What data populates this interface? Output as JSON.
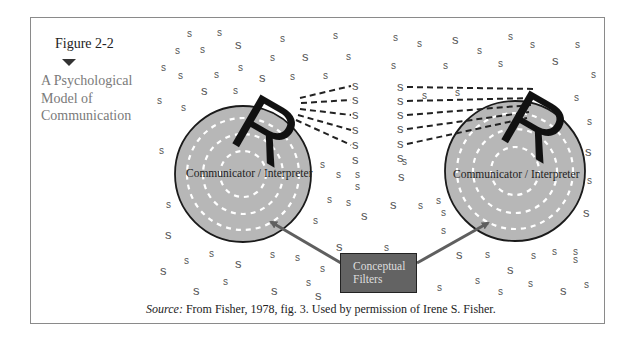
{
  "figure": {
    "label": "Figure 2-2",
    "title_lines": [
      "A Psychological",
      "Model of",
      "Communication"
    ]
  },
  "communicators": [
    {
      "label": "Communicator / Interpreter",
      "cx": 243,
      "cy": 174,
      "r": 68,
      "r_letter": "R"
    },
    {
      "label": "Communicator / Interpreter",
      "cx": 515,
      "cy": 171,
      "r": 70,
      "r_letter": "R"
    }
  ],
  "filter_box": {
    "lines": [
      "Conceptual",
      "Filters"
    ]
  },
  "source": {
    "prefix": "Source:",
    "text": " From Fisher, 1978, fig. 3. Used by permission of Irene S. Fisher."
  },
  "stimulus_letter": "s",
  "colors": {
    "circle_fill": "#b7b7b7",
    "circle_stroke": "#1a1a1a",
    "ring_dash": "#ffffff",
    "arrow": "#5f5f5f",
    "filter_fill": "#636363",
    "filter_text": "#dedede",
    "s_color": "#555555",
    "frame": "#8a8a8a"
  }
}
